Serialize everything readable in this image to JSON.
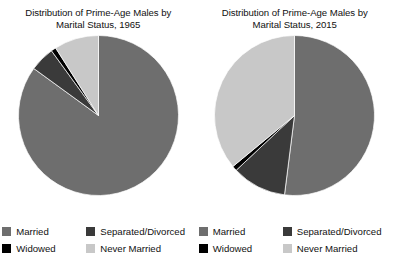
{
  "figure": {
    "background": "#ffffff"
  },
  "colors": {
    "married": "#6e6e6e",
    "separated_divorced": "#3a3a3a",
    "widowed": "#000000",
    "never_married": "#c8c8c8"
  },
  "legend": {
    "items": [
      {
        "label": "Married",
        "color": "#6e6e6e",
        "key": "married"
      },
      {
        "label": "Separated/Divorced",
        "color": "#3a3a3a",
        "key": "separated_divorced"
      },
      {
        "label": "Widowed",
        "color": "#000000",
        "key": "widowed"
      },
      {
        "label": "Never Married",
        "color": "#c8c8c8",
        "key": "never_married"
      }
    ]
  },
  "panels": [
    {
      "title": "Distribution of Prime-Age Males by\nMarital Status, 1965",
      "year": "1965"
    },
    {
      "title": "Distribution of Prime-Age Males by\nMarital Status, 2015",
      "year": "2015"
    }
  ],
  "chart_data": [
    {
      "type": "pie",
      "title": "Distribution of Prime-Age Males by Marital Status, 1965",
      "labels": [
        "Married",
        "Separated/Divorced",
        "Widowed",
        "Never Married"
      ],
      "values": [
        85,
        5,
        1,
        9
      ],
      "unit": "percent",
      "start_angle_deg": 0,
      "direction": "clockwise",
      "colors": [
        "#6e6e6e",
        "#3a3a3a",
        "#000000",
        "#c8c8c8"
      ],
      "draw_order": [
        "Married",
        "Separated/Divorced",
        "Widowed",
        "Never Married"
      ],
      "legend_position": "bottom",
      "grid": false
    },
    {
      "type": "pie",
      "title": "Distribution of Prime-Age Males by Marital Status, 2015",
      "labels": [
        "Married",
        "Separated/Divorced",
        "Widowed",
        "Never Married"
      ],
      "values": [
        52,
        11,
        1,
        36
      ],
      "unit": "percent",
      "start_angle_deg": 0,
      "direction": "clockwise",
      "colors": [
        "#6e6e6e",
        "#3a3a3a",
        "#000000",
        "#c8c8c8"
      ],
      "draw_order": [
        "Married",
        "Separated/Divorced",
        "Widowed",
        "Never Married"
      ],
      "legend_position": "bottom",
      "grid": false
    }
  ]
}
